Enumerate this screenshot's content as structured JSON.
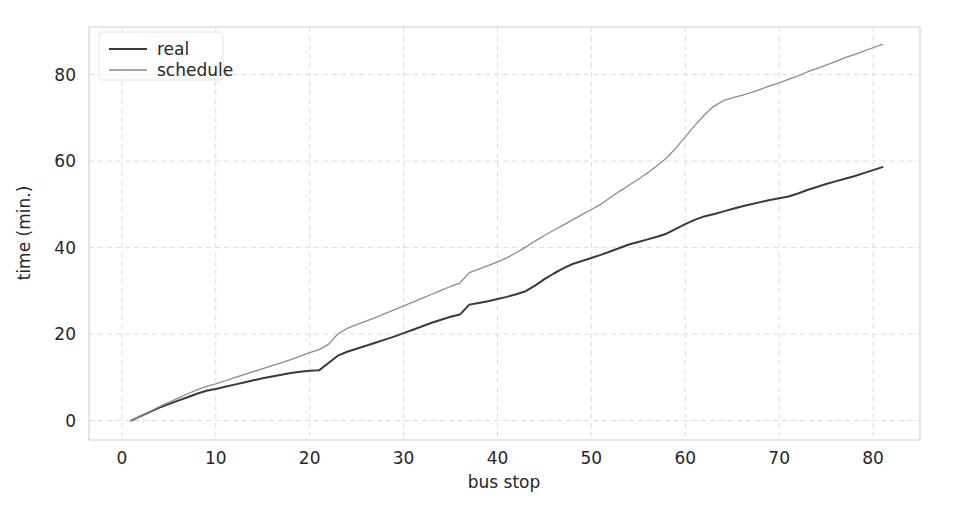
{
  "chart_data": {
    "type": "line",
    "title": "",
    "xlabel": "bus stop",
    "ylabel": "time (min.)",
    "xlim": [
      -3.5,
      85
    ],
    "ylim": [
      -4.5,
      91
    ],
    "xticks": [
      0,
      10,
      20,
      30,
      40,
      50,
      60,
      70,
      80
    ],
    "yticks": [
      0,
      20,
      40,
      60,
      80
    ],
    "xticklabels": [
      "0",
      "10",
      "20",
      "30",
      "40",
      "50",
      "60",
      "70",
      "80"
    ],
    "yticklabels": [
      "0",
      "20",
      "40",
      "60",
      "80"
    ],
    "grid": true,
    "grid_style": "dashed",
    "legend_position": "upper left",
    "legend_entries": [
      "real",
      "schedule"
    ],
    "series": [
      {
        "name": "real",
        "color": "#3a3a3a",
        "linewidth": 2.0,
        "linestyle": "solid",
        "x": [
          1,
          2,
          3,
          4,
          5,
          6,
          7,
          8,
          9,
          10,
          11,
          12,
          13,
          14,
          15,
          16,
          17,
          18,
          19,
          20,
          21,
          22,
          23,
          24,
          25,
          26,
          27,
          28,
          29,
          30,
          31,
          32,
          33,
          34,
          35,
          36,
          37,
          38,
          39,
          40,
          41,
          42,
          43,
          44,
          45,
          46,
          47,
          48,
          49,
          50,
          51,
          52,
          53,
          54,
          55,
          56,
          57,
          58,
          59,
          60,
          61,
          62,
          63,
          64,
          65,
          66,
          67,
          68,
          69,
          70,
          71,
          72,
          73,
          74,
          75,
          76,
          77,
          78,
          79,
          80,
          81
        ],
        "y": [
          0.0,
          1.0,
          2.0,
          3.0,
          3.8,
          4.6,
          5.4,
          6.2,
          6.9,
          7.3,
          7.8,
          8.3,
          8.8,
          9.3,
          9.8,
          10.2,
          10.6,
          11.0,
          11.3,
          11.5,
          11.6,
          13.3,
          15.0,
          15.9,
          16.6,
          17.3,
          18.0,
          18.7,
          19.4,
          20.2,
          21.0,
          21.8,
          22.6,
          23.3,
          24.0,
          24.5,
          26.8,
          27.2,
          27.6,
          28.1,
          28.6,
          29.2,
          29.9,
          31.2,
          32.7,
          34.0,
          35.2,
          36.2,
          36.9,
          37.6,
          38.3,
          39.1,
          39.9,
          40.7,
          41.3,
          41.9,
          42.5,
          43.2,
          44.3,
          45.4,
          46.4,
          47.2,
          47.7,
          48.3,
          48.9,
          49.5,
          50.0,
          50.5,
          51.0,
          51.4,
          51.8,
          52.5,
          53.3,
          54.0,
          54.7,
          55.3,
          55.9,
          56.5,
          57.2,
          57.9,
          58.6
        ]
      },
      {
        "name": "schedule",
        "color": "#8c8c8c",
        "linewidth": 1.3,
        "linestyle": "solid",
        "x": [
          1,
          2,
          3,
          4,
          5,
          6,
          7,
          8,
          9,
          10,
          11,
          12,
          13,
          14,
          15,
          16,
          17,
          18,
          19,
          20,
          21,
          22,
          23,
          24,
          25,
          26,
          27,
          28,
          29,
          30,
          31,
          32,
          33,
          34,
          35,
          36,
          37,
          38,
          39,
          40,
          41,
          42,
          43,
          44,
          45,
          46,
          47,
          48,
          49,
          50,
          51,
          52,
          53,
          54,
          55,
          56,
          57,
          58,
          59,
          60,
          61,
          62,
          63,
          64,
          65,
          66,
          67,
          68,
          69,
          70,
          71,
          72,
          73,
          74,
          75,
          76,
          77,
          78,
          79,
          80,
          81
        ],
        "y": [
          0.0,
          1.0,
          2.1,
          3.2,
          4.2,
          5.2,
          6.2,
          7.1,
          7.9,
          8.5,
          9.2,
          9.9,
          10.6,
          11.3,
          12.0,
          12.7,
          13.4,
          14.1,
          14.9,
          15.7,
          16.4,
          17.6,
          20.0,
          21.3,
          22.2,
          23.0,
          23.8,
          24.7,
          25.6,
          26.5,
          27.4,
          28.3,
          29.2,
          30.1,
          31.0,
          31.8,
          34.2,
          35.0,
          35.8,
          36.7,
          37.6,
          38.8,
          40.1,
          41.5,
          42.8,
          44.0,
          45.2,
          46.4,
          47.6,
          48.8,
          50.0,
          51.5,
          53.0,
          54.4,
          55.8,
          57.3,
          58.9,
          60.7,
          63.0,
          65.6,
          68.2,
          70.6,
          72.6,
          73.9,
          74.6,
          75.2,
          75.8,
          76.6,
          77.4,
          78.1,
          78.9,
          79.7,
          80.6,
          81.4,
          82.2,
          83.0,
          83.9,
          84.6,
          85.4,
          86.2,
          87.0
        ]
      }
    ]
  },
  "axes": {
    "plot_left_px": 89,
    "plot_right_px": 920,
    "plot_top_px": 27,
    "plot_bottom_px": 440
  }
}
